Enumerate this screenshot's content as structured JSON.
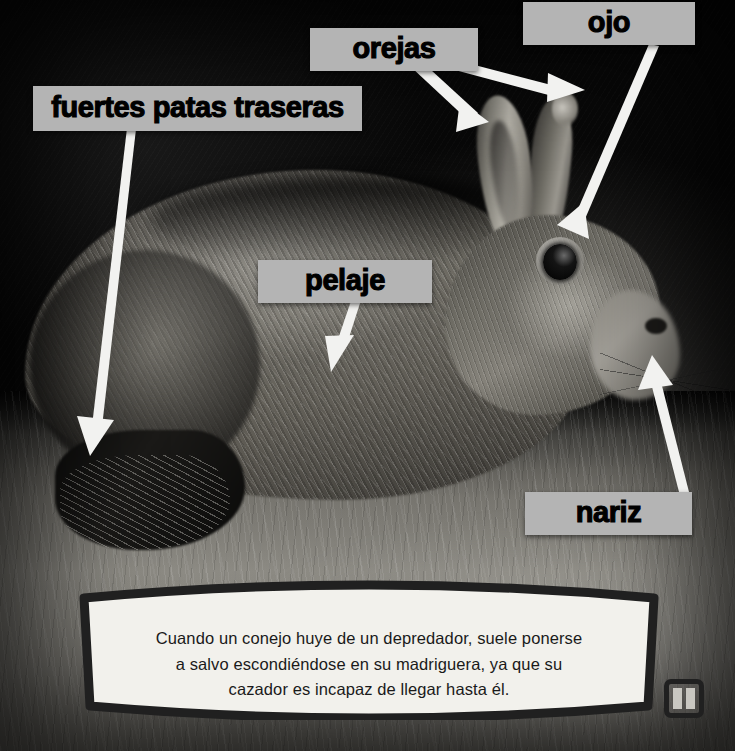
{
  "page": {
    "language": "es",
    "palette": {
      "label_background": "#b4b4b4",
      "label_text": "#000000",
      "arrow": "#f2f2f0",
      "caption_background": "#f2f1ec",
      "caption_border": "#202020",
      "caption_text": "#1a1a1a"
    }
  },
  "photo": {
    "subject": "conejo",
    "alt": "Fotografía en blanco y negro de un conejo entre la hierba",
    "style": "grayscale"
  },
  "callouts": [
    {
      "id": "fuertes-patas-traseras",
      "label": "fuertes patas traseras",
      "box": {
        "x": 33,
        "y": 86,
        "w": 329,
        "h": 45
      },
      "arrow_from": {
        "x": 131,
        "y": 131
      },
      "arrow_to": {
        "x": 90,
        "y": 452
      }
    },
    {
      "id": "orejas",
      "label": "orejas",
      "box": {
        "x": 310,
        "y": 28,
        "w": 168,
        "h": 43
      },
      "arrow_from": {
        "x": 426,
        "y": 71
      },
      "arrow_to": {
        "x": 488,
        "y": 118
      }
    },
    {
      "id": "orejas-2",
      "label": "",
      "box": null,
      "arrow_from": {
        "x": 455,
        "y": 71
      },
      "arrow_to": {
        "x": 579,
        "y": 91
      }
    },
    {
      "id": "ojo",
      "label": "ojo",
      "box": {
        "x": 523,
        "y": 2,
        "w": 172,
        "h": 43
      },
      "arrow_from": {
        "x": 654,
        "y": 45
      },
      "arrow_to": {
        "x": 571,
        "y": 232
      }
    },
    {
      "id": "pelaje",
      "label": "pelaje",
      "box": {
        "x": 258,
        "y": 260,
        "w": 174,
        "h": 43
      },
      "arrow_from": {
        "x": 356,
        "y": 303
      },
      "arrow_to": {
        "x": 330,
        "y": 367
      }
    },
    {
      "id": "nariz",
      "label": "nariz",
      "box": {
        "x": 525,
        "y": 492,
        "w": 167,
        "h": 43
      },
      "arrow_from": {
        "x": 684,
        "y": 492
      },
      "arrow_to": {
        "x": 648,
        "y": 357
      }
    }
  ],
  "caption": {
    "lines": [
      "Cuando un conejo huye de un depredador, suele ponerse",
      "a salvo escondiéndose en su madriguera, ya que su",
      "cazador es incapaz de llegar hasta él."
    ],
    "full_text": "Cuando un conejo huye de un depredador, suele ponerse a salvo escondiéndose en su madriguera, ya que su cazador es incapaz de llegar hasta él."
  },
  "controls": {
    "pause": {
      "icon": "pause-icon",
      "label": "Pausa",
      "state": "playing"
    }
  }
}
